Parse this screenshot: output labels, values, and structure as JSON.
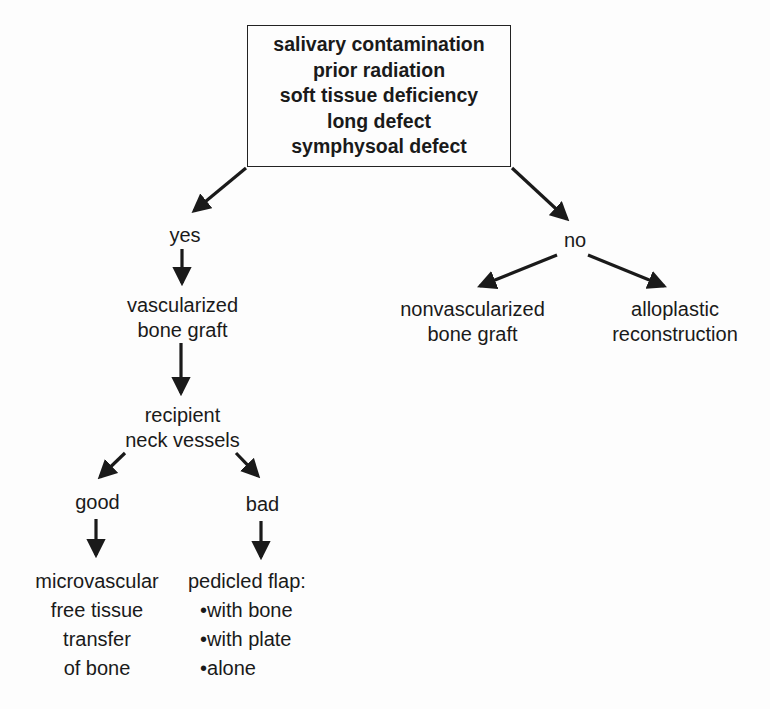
{
  "criteria_box": {
    "lines": [
      "salivary contamination",
      "prior radiation",
      "soft tissue deficiency",
      "long defect",
      "symphysoal defect"
    ]
  },
  "branches": {
    "yes": "yes",
    "no": "no"
  },
  "yes_path": {
    "vascularized": [
      "vascularized",
      "bone graft"
    ],
    "recipient": [
      "recipient",
      "neck vessels"
    ],
    "good": "good",
    "bad": "bad",
    "microvascular": [
      "microvascular",
      "free tissue",
      "transfer",
      "of bone"
    ],
    "pedicled": {
      "title": "pedicled flap:",
      "bullets": [
        "•with bone",
        "•with plate",
        "•alone"
      ]
    }
  },
  "no_path": {
    "nonvascularized": [
      "nonvascularized",
      "bone graft"
    ],
    "alloplastic": [
      "alloplastic",
      "reconstruction"
    ]
  }
}
